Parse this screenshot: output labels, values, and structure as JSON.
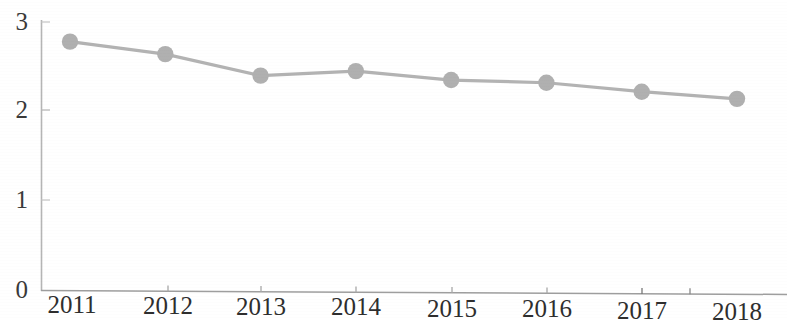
{
  "chart_data": {
    "type": "line",
    "title": "",
    "subtitle": "",
    "xlabel": "",
    "ylabel": "",
    "categories": [
      "2011",
      "2012",
      "2013",
      "2014",
      "2015",
      "2016",
      "2017",
      "2018"
    ],
    "values": [
      2.78,
      2.64,
      2.4,
      2.45,
      2.35,
      2.32,
      2.22,
      2.14
    ],
    "series": [
      {
        "name": "",
        "values": [
          2.78,
          2.64,
          2.4,
          2.45,
          2.35,
          2.32,
          2.22,
          2.14
        ]
      }
    ],
    "ylim": [
      0,
      3
    ],
    "xlim": [
      "2011",
      "2018"
    ],
    "y_ticks": [
      "0",
      "1",
      "2",
      "3"
    ],
    "y_tick_values": [
      0,
      1,
      2,
      3
    ],
    "x_ticks": [
      "2011",
      "2012",
      "2013",
      "2014",
      "2015",
      "2016",
      "2017",
      "2018"
    ],
    "grid": false,
    "legend": false,
    "legend_position": "none",
    "marker": "circle",
    "line_color": "#b3b3b3",
    "marker_color": "#b0b0b0",
    "axis_color": "#9a9a9a",
    "text_color": "#2e2e2e",
    "background_color": "#ffffff",
    "annotations": []
  },
  "axes": {
    "y_labels": [
      {
        "text": "3",
        "value": 3
      },
      {
        "text": "2",
        "value": 2
      },
      {
        "text": "1",
        "value": 1
      },
      {
        "text": "0",
        "value": 0
      }
    ],
    "x_labels": [
      {
        "text": "2011"
      },
      {
        "text": "2012"
      },
      {
        "text": "2013"
      },
      {
        "text": "2014"
      },
      {
        "text": "2015"
      },
      {
        "text": "2016"
      },
      {
        "text": "2017"
      },
      {
        "text": "2018"
      }
    ]
  }
}
